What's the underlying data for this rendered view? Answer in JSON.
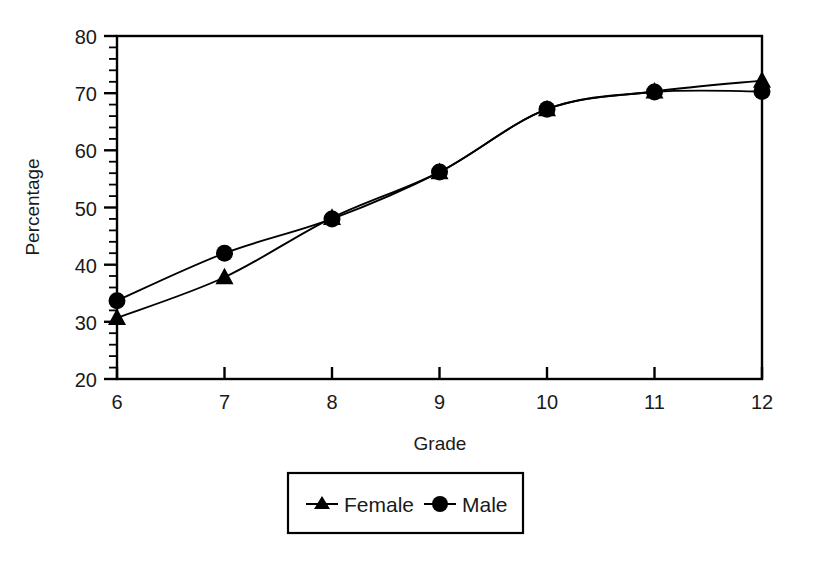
{
  "chart_data": {
    "type": "line",
    "title": "",
    "xlabel": "Grade",
    "ylabel": "Percentage",
    "x": [
      6,
      7,
      8,
      9,
      10,
      11,
      12
    ],
    "categories": [
      "6",
      "7",
      "8",
      "9",
      "10",
      "11",
      "12"
    ],
    "series": [
      {
        "name": "Female",
        "marker": "triangle",
        "values": [
          30.7,
          37.8,
          48.2,
          56.2,
          67.2,
          70.3,
          72.2
        ]
      },
      {
        "name": "Male",
        "marker": "circle",
        "values": [
          33.7,
          42.0,
          48.0,
          56.2,
          67.2,
          70.2,
          70.3
        ]
      }
    ],
    "xlim": [
      6,
      12
    ],
    "ylim": [
      20,
      80
    ],
    "x_ticks": [
      "6",
      "7",
      "8",
      "9",
      "10",
      "11",
      "12"
    ],
    "y_ticks": [
      "20",
      "30",
      "40",
      "50",
      "60",
      "70",
      "80"
    ],
    "y_minor_tick_step": 2,
    "grid": false,
    "legend_position": "bottom-center",
    "line_color": "#000000",
    "marker_color": "#000000",
    "frame_color": "#000000"
  },
  "axes": {
    "y_title": "Percentage",
    "x_title": "Grade",
    "y_tick_labels": [
      "80",
      "70",
      "60",
      "50",
      "40",
      "30",
      "20"
    ],
    "x_tick_labels": [
      "6",
      "7",
      "8",
      "9",
      "10",
      "11",
      "12"
    ]
  },
  "legend": {
    "entries": [
      {
        "label": "Female",
        "marker": "triangle-marker"
      },
      {
        "label": "Male",
        "marker": "circle-marker"
      }
    ]
  }
}
